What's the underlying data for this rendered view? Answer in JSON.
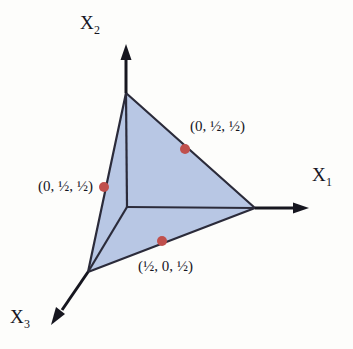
{
  "figure": {
    "background_color": "#fdfdfb",
    "surface": {
      "name": "unit-simplex-triangle",
      "fill_color": "#b8c7e4",
      "fill_opacity": 0.95,
      "edge_color": "#2b2b3a",
      "vertices": [
        {
          "label": "x2-intercept",
          "x": 126,
          "y": 93
        },
        {
          "label": "x1-intercept",
          "x": 255,
          "y": 208
        },
        {
          "label": "x3-intercept",
          "x": 88,
          "y": 272
        }
      ]
    },
    "origin": {
      "x": 127,
      "y": 207
    },
    "axes": [
      {
        "id": "x1",
        "label": "X",
        "subscript": "1",
        "direction": "right",
        "tip": {
          "x": 300,
          "y": 208
        },
        "color": "#16161f"
      },
      {
        "id": "x2",
        "label": "X",
        "subscript": "2",
        "direction": "up",
        "tip": {
          "x": 126,
          "y": 47
        },
        "color": "#16161f"
      },
      {
        "id": "x3",
        "label": "X",
        "subscript": "3",
        "direction": "down-left",
        "tip": {
          "x": 52,
          "y": 318
        },
        "color": "#16161f"
      }
    ],
    "points": [
      {
        "id": "p1",
        "text": "(0, ½, ½)",
        "marker_color": "#c0504d",
        "marker": {
          "x": 185,
          "y": 149
        },
        "label_position": "right"
      },
      {
        "id": "p2",
        "text": "(0, ½, ½)",
        "marker_color": "#c0504d",
        "marker": {
          "x": 104,
          "y": 187
        },
        "label_position": "left"
      },
      {
        "id": "p3",
        "text": "(½, 0, ½)",
        "marker_color": "#c0504d",
        "marker": {
          "x": 162,
          "y": 241
        },
        "label_position": "below"
      }
    ]
  }
}
